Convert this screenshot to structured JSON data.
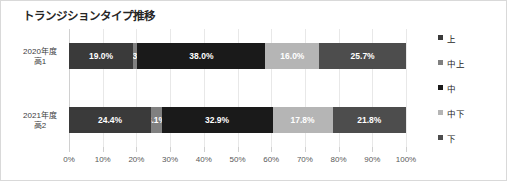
{
  "chart_data": {
    "type": "bar",
    "subtype": "100%-stacked-horizontal-bar",
    "title": "トランジションタイプ推移",
    "xlabel": "",
    "ylabel": "",
    "categories": [
      "2020年度\n高1",
      "2021年度\n高2"
    ],
    "category_lines": [
      {
        "line1": "2020年度",
        "line2": "高1"
      },
      {
        "line1": "2021年度",
        "line2": "高2"
      }
    ],
    "series": [
      {
        "name": "上",
        "color": "#3a3a3a",
        "values": [
          19.0,
          24.4
        ],
        "labels": [
          "19.0%",
          "24.4%"
        ]
      },
      {
        "name": "中上",
        "color": "#808080",
        "values": [
          1.3,
          3.1
        ],
        "labels": [
          "1.3%",
          "3.1%"
        ]
      },
      {
        "name": "中",
        "color": "#1a1a1a",
        "values": [
          38.0,
          32.9
        ],
        "labels": [
          "38.0%",
          "32.9%"
        ]
      },
      {
        "name": "中下",
        "color": "#b5b5b5",
        "values": [
          16.0,
          17.8
        ],
        "labels": [
          "16.0%",
          "17.8%"
        ]
      },
      {
        "name": "下",
        "color": "#4d4d4d",
        "values": [
          25.7,
          21.8
        ],
        "labels": [
          "25.7%",
          "21.8%"
        ]
      }
    ],
    "xlim": [
      0,
      100
    ],
    "xticks": [
      0,
      10,
      20,
      30,
      40,
      50,
      60,
      70,
      80,
      90,
      100
    ],
    "xtick_labels": [
      "0%",
      "10%",
      "20%",
      "30%",
      "40%",
      "50%",
      "60%",
      "70%",
      "80%",
      "90%",
      "100%"
    ],
    "grid": true,
    "grid_axis": "x",
    "legend_position": "right",
    "legend_entries": [
      "上",
      "中上",
      "中",
      "中下",
      "下"
    ],
    "data_labels_shown": true,
    "background_color": "#ffffff",
    "border_color": "#d9d9d9",
    "title_color": "#262626",
    "data_label_color": "#ffffff"
  }
}
